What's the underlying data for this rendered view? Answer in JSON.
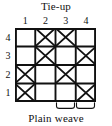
{
  "figure": {
    "title": "Tie-up",
    "caption": "Plain weave",
    "colors": {
      "ink": "#111111",
      "background": "#ffffff",
      "grid_line": "#111111",
      "mark": "#111111"
    }
  },
  "axes": {
    "column_labels": [
      "1",
      "2",
      "3",
      "4"
    ],
    "row_labels": [
      "4",
      "3",
      "2",
      "1"
    ]
  },
  "chart_data": {
    "type": "heatmap",
    "title": "Tie-up",
    "xlabel": "",
    "ylabel": "",
    "subtitle": "Plain weave",
    "grid": true,
    "legend_position": "none",
    "columns": [
      "1",
      "2",
      "3",
      "4"
    ],
    "rows": [
      "4",
      "3",
      "2",
      "1"
    ],
    "cell_marks": {
      "filled": "X",
      "empty": ""
    },
    "values": [
      [
        0,
        1,
        1,
        0
      ],
      [
        0,
        1,
        0,
        1
      ],
      [
        1,
        0,
        1,
        0
      ],
      [
        1,
        0,
        0,
        1
      ]
    ],
    "cells": [
      {
        "row": "4",
        "col": "1",
        "mark": ""
      },
      {
        "row": "4",
        "col": "2",
        "mark": "X"
      },
      {
        "row": "4",
        "col": "3",
        "mark": "X"
      },
      {
        "row": "4",
        "col": "4",
        "mark": ""
      },
      {
        "row": "3",
        "col": "1",
        "mark": ""
      },
      {
        "row": "3",
        "col": "2",
        "mark": "X"
      },
      {
        "row": "3",
        "col": "3",
        "mark": ""
      },
      {
        "row": "3",
        "col": "4",
        "mark": "X"
      },
      {
        "row": "2",
        "col": "1",
        "mark": "X"
      },
      {
        "row": "2",
        "col": "2",
        "mark": ""
      },
      {
        "row": "2",
        "col": "3",
        "mark": "X"
      },
      {
        "row": "2",
        "col": "4",
        "mark": ""
      },
      {
        "row": "1",
        "col": "1",
        "mark": "X"
      },
      {
        "row": "1",
        "col": "2",
        "mark": ""
      },
      {
        "row": "1",
        "col": "3",
        "mark": ""
      },
      {
        "row": "1",
        "col": "4",
        "mark": "X"
      }
    ],
    "annotations": [
      {
        "type": "brace",
        "label": "",
        "spans_columns": [
          "3"
        ]
      },
      {
        "type": "brace",
        "label": "",
        "spans_columns": [
          "4"
        ]
      },
      {
        "type": "text",
        "label": "Plain weave",
        "position": "below"
      }
    ]
  }
}
